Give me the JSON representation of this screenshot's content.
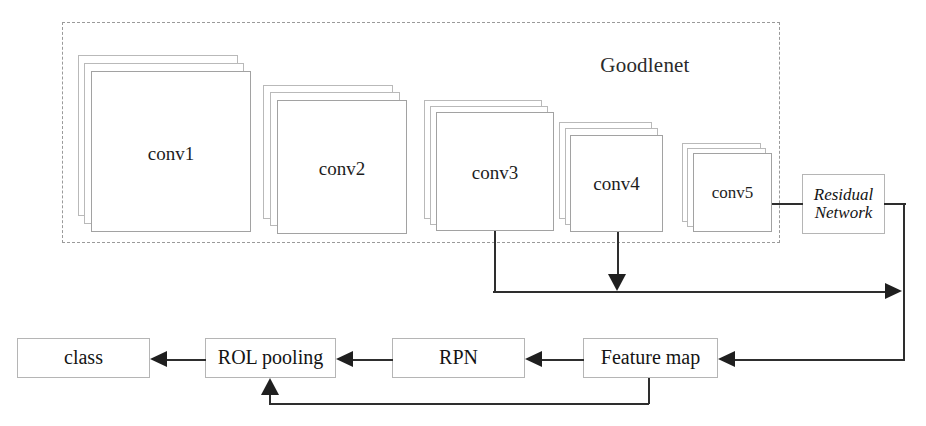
{
  "diagram": {
    "title": "",
    "group": {
      "label": "Goodlenet",
      "style": "dashed"
    },
    "conv_blocks": [
      {
        "label": "conv1",
        "layers": 3
      },
      {
        "label": "conv2",
        "layers": 3
      },
      {
        "label": "conv3",
        "layers": 3
      },
      {
        "label": "conv4",
        "layers": 3
      },
      {
        "label": "conv5",
        "layers": 3
      }
    ],
    "nodes": {
      "residual_network": "Residual\nNetwork",
      "residual_network_line1": "Residual",
      "residual_network_line2": "Network",
      "class": "class",
      "roi_pooling": "ROL pooling",
      "rpn": "RPN",
      "feature_map": "Feature map"
    },
    "edges": [
      {
        "from": "conv5",
        "to": "residual_network",
        "head": "none"
      },
      {
        "from": "conv3",
        "to": "merge-line",
        "head": "none"
      },
      {
        "from": "conv4",
        "to": "merge-line",
        "head": "arrow-down"
      },
      {
        "from": "merge-line",
        "to": "residual-trunk",
        "head": "arrow-right"
      },
      {
        "from": "residual_network",
        "to": "feature_map",
        "head": "arrow-left"
      },
      {
        "from": "feature_map",
        "to": "rpn",
        "head": "arrow-left"
      },
      {
        "from": "rpn",
        "to": "roi_pooling",
        "head": "arrow-left"
      },
      {
        "from": "roi_pooling",
        "to": "class",
        "head": "arrow-left"
      },
      {
        "from": "feature_map",
        "to": "roi_pooling",
        "head": "arrow-up"
      }
    ],
    "colors": {
      "line": "#2e2e2e",
      "arrowhead": "#1f1f1f",
      "box_border": "#b5b5b5",
      "group_border": "#9a9a9a",
      "background": "#ffffff",
      "text": "#141414"
    }
  }
}
